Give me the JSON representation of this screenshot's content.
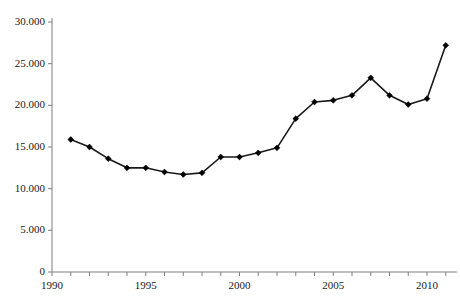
{
  "chart_data": {
    "type": "line",
    "title": "",
    "xlabel": "",
    "ylabel": "",
    "x": [
      1991,
      1992,
      1993,
      1994,
      1995,
      1996,
      1997,
      1998,
      1999,
      2000,
      2001,
      2002,
      2003,
      2004,
      2005,
      2006,
      2007,
      2008,
      2009,
      2010,
      2011
    ],
    "values": [
      15900,
      15000,
      13600,
      12500,
      12500,
      12000,
      11700,
      11900,
      13800,
      13800,
      14300,
      14900,
      18400,
      20400,
      20600,
      21200,
      23300,
      21200,
      20100,
      20800,
      27200
    ],
    "series": [
      {
        "name": "series-1",
        "values": [
          15900,
          15000,
          13600,
          12500,
          12500,
          12000,
          11700,
          11900,
          13800,
          13800,
          14300,
          14900,
          18400,
          20400,
          20600,
          21200,
          23300,
          21200,
          20100,
          20800,
          27200
        ]
      }
    ],
    "xlim": [
      1990,
      2011.6
    ],
    "ylim": [
      0,
      30000
    ],
    "grid": false,
    "legend": false,
    "marker": "diamond",
    "line_color": "#1a1a1a",
    "marker_color": "#000000",
    "axis_color": "#7f7f7f",
    "y_ticks": [
      0,
      5000,
      10000,
      15000,
      20000,
      25000,
      30000
    ],
    "y_tick_labels": [
      "0",
      "5.000",
      "10.000",
      "15.000",
      "20.000",
      "25.000",
      "30.000"
    ],
    "x_ticks": [
      1990,
      1991,
      1992,
      1993,
      1994,
      1995,
      1996,
      1997,
      1998,
      1999,
      2000,
      2001,
      2002,
      2003,
      2004,
      2005,
      2006,
      2007,
      2008,
      2009,
      2010,
      2011
    ],
    "x_tick_labels_shown": [
      {
        "year": 1990,
        "label": "1990"
      },
      {
        "year": 1995,
        "label": "1995"
      },
      {
        "year": 2000,
        "label": "2000"
      },
      {
        "year": 2005,
        "label": "2005"
      },
      {
        "year": 2010,
        "label": "2010"
      }
    ]
  }
}
